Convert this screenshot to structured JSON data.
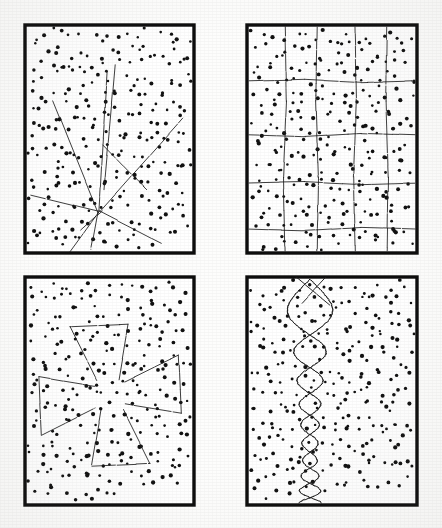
{
  "figure": {
    "kind": "scanned-figure-plate",
    "title": "",
    "caption": "",
    "background_color": "#fdfdfc",
    "ink_color": "#101010",
    "panel_count": 4,
    "layout": {
      "rows": 2,
      "cols": 2
    },
    "point_radius_px": 1.6,
    "frame": {
      "stroke_color": "#0d0d0d",
      "stroke_width_px": 3.2,
      "style": "heavy-black-rectangle"
    }
  },
  "chart_data": {
    "type": "scatter",
    "title": "",
    "xlabel": "",
    "ylabel": "",
    "xlim": [
      0,
      170
    ],
    "ylim": [
      0,
      228
    ],
    "grid": false,
    "legend": null,
    "panels": [
      {
        "id": "panel-top-left",
        "label": "",
        "position": {
          "x": 25,
          "y": 25,
          "width": 169,
          "height": 228
        },
        "pattern": "radial-lines-from-focus",
        "focus_point": [
          76,
          186
        ],
        "n_points": 268,
        "overlay_description": "several long straight line segments fanning out from a common focus near the lower-left-centre",
        "overlay_segments": [
          [
            28,
            76,
            73,
            188
          ],
          [
            82,
            47,
            74,
            186
          ],
          [
            56,
            205,
            77,
            186
          ],
          [
            6,
            170,
            76,
            187
          ],
          [
            75,
            186,
            158,
            93
          ],
          [
            74,
            186,
            136,
            218
          ],
          [
            74,
            187,
            45,
            227
          ],
          [
            73,
            186,
            66,
            224
          ],
          [
            90,
            40,
            79,
            165
          ],
          [
            78,
            120,
            122,
            165
          ]
        ],
        "seed": 11
      },
      {
        "id": "panel-top-right",
        "label": "",
        "position": {
          "x": 247,
          "y": 25,
          "width": 170,
          "height": 228
        },
        "pattern": "orthogonal-grid",
        "n_points": 272,
        "overlay_description": "a roughly rectangular lattice of broken vertical and horizontal rules dividing the field into cells",
        "vertical_lines_x": [
          38,
          70,
          108,
          140
        ],
        "horizontal_lines_y": [
          56,
          110,
          158,
          204
        ],
        "seed": 23
      },
      {
        "id": "panel-bottom-left",
        "label": "",
        "position": {
          "x": 25,
          "y": 277,
          "width": 169,
          "height": 228
        },
        "pattern": "pinwheel-cross",
        "center_point": [
          85,
          118
        ],
        "n_points": 265,
        "overlay_description": "four trapezoidal blade shapes arranged pinwheel-fashion about the centre, forming a cross/maltese motif",
        "seed": 37
      },
      {
        "id": "panel-bottom-right",
        "label": "",
        "position": {
          "x": 247,
          "y": 277,
          "width": 170,
          "height": 228
        },
        "pattern": "braided-sine-chain",
        "n_points": 276,
        "overlay_description": "two sinusoids winding about a vertical axis and crossing repeatedly, forming a chain of lens shapes whose amplitude decreases downwards",
        "axis_x": 63,
        "amplitudes": [
          30,
          20,
          14,
          10,
          7,
          12
        ],
        "seed": 53
      }
    ]
  }
}
